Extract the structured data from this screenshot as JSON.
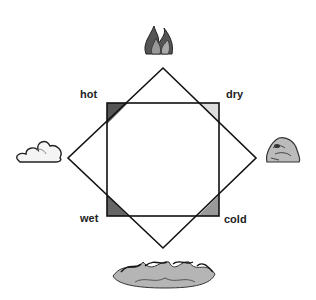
{
  "diagram": {
    "qualities": {
      "hot": "hot",
      "dry": "dry",
      "wet": "wet",
      "cold": "cold"
    },
    "elements": [
      {
        "name": "fire",
        "icon": "fire-icon",
        "position": "top"
      },
      {
        "name": "air",
        "icon": "cloud-icon",
        "position": "left"
      },
      {
        "name": "earth",
        "icon": "rock-icon",
        "position": "right"
      },
      {
        "name": "water",
        "icon": "water-waves-icon",
        "position": "bottom"
      }
    ],
    "corner_fills": {
      "hot": "#555555",
      "dry": "#dddddd",
      "wet": "#666666",
      "cold": "#999999"
    }
  }
}
